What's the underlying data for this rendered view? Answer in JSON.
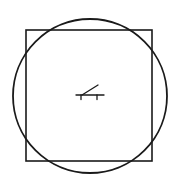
{
  "diagram": {
    "width": 179,
    "height": 185,
    "stroke_color": "#1a1a1a",
    "background": "#ffffff",
    "square": {
      "x": 26,
      "y": 30,
      "width": 126,
      "height": 131,
      "stroke_width": 1.6
    },
    "circle": {
      "cx": 90,
      "cy": 96,
      "r": 77,
      "stroke_width": 1.8
    },
    "center_symbol": {
      "name": "bench-with-inclined-line",
      "base": {
        "x1": 76,
        "y1": 95,
        "x2": 104,
        "y2": 95
      },
      "left_leg": {
        "x1": 81,
        "y1": 95,
        "x2": 81,
        "y2": 99.5
      },
      "right_leg": {
        "x1": 97,
        "y1": 95,
        "x2": 97,
        "y2": 99.5
      },
      "incline": {
        "x1": 82,
        "y1": 95,
        "x2": 98,
        "y2": 85
      },
      "stroke_width": 1.3
    }
  }
}
